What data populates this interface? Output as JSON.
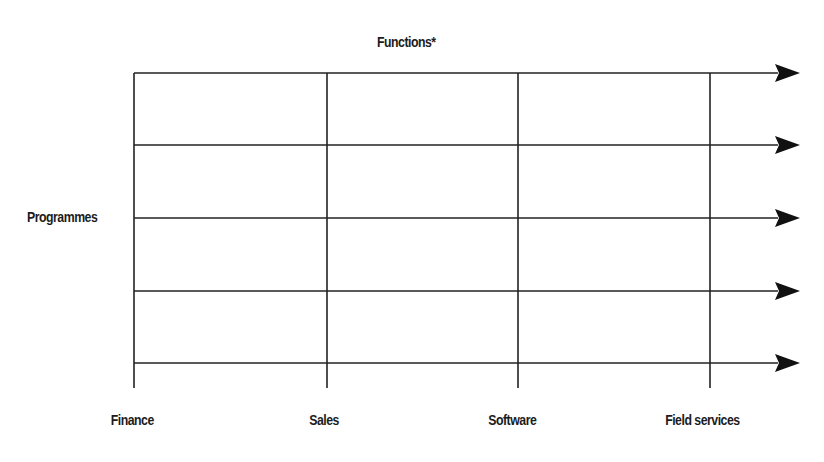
{
  "diagram": {
    "title": "Functions*",
    "row_axis_label": "Programmes",
    "columns": [
      {
        "label": "Finance",
        "x": 135
      },
      {
        "label": "Sales",
        "x": 327
      },
      {
        "label": "Software",
        "x": 518
      },
      {
        "label": "Field services",
        "x": 710
      }
    ],
    "row_lines_y": [
      73,
      145,
      218,
      291,
      363
    ],
    "line_color": "#222222",
    "arrow_tip_x": 800
  }
}
